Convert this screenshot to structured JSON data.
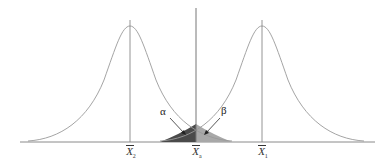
{
  "diagram": {
    "type": "two-normal-distributions-hypothesis-test",
    "colors": {
      "curve": "#9a9a9a",
      "axis": "#7a7a7a",
      "alpha_region": "#4a4a4a",
      "beta_region": "#a8a8a8"
    },
    "labels": {
      "alpha": "α",
      "beta": "β",
      "x2": "X",
      "x2_sub": "2",
      "xc": "X",
      "xc_sub": "a",
      "x1": "X",
      "x1_sub": "1"
    }
  }
}
